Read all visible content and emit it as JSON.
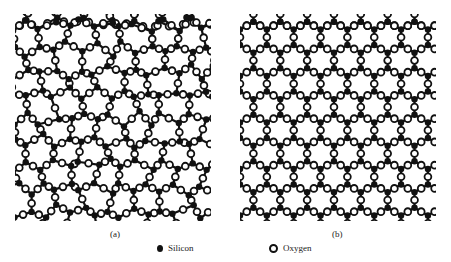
{
  "figure": {
    "panels": [
      {
        "id": "a",
        "caption": "(a)",
        "structure": "amorphous silica network (irregular rings)"
      },
      {
        "id": "b",
        "caption": "(b)",
        "structure": "crystalline silica network (regular hexagonal rings)"
      }
    ],
    "legend": [
      {
        "label": "Silicon",
        "icon": "filled-circle-icon",
        "color": "#111111"
      },
      {
        "label": "Oxygen",
        "icon": "hollow-circle-icon",
        "color": "#111111"
      }
    ],
    "colors": {
      "atom_stroke": "#111111",
      "background": "#ffffff"
    }
  }
}
